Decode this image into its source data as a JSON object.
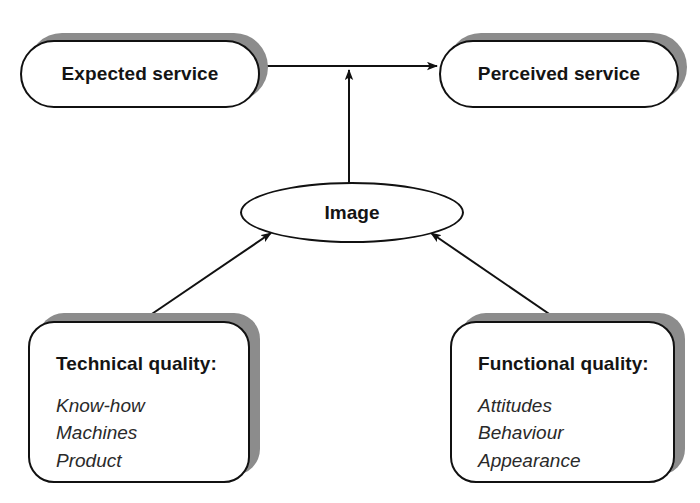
{
  "diagram": {
    "background_color": "#ffffff",
    "line_color": "#111111",
    "shadow_color": "#8c8c8c",
    "text_color": "#141414"
  },
  "nodes": {
    "expected_service": {
      "label": "Expected service",
      "shape": "rounded-pill"
    },
    "perceived_service": {
      "label": "Perceived service",
      "shape": "rounded-pill"
    },
    "image": {
      "label": "Image",
      "shape": "ellipse"
    },
    "technical_quality": {
      "title": "Technical quality:",
      "items": [
        "Know-how",
        "Machines",
        "Product"
      ],
      "shape": "rounded-rect"
    },
    "functional_quality": {
      "title": "Functional quality:",
      "items": [
        "Attitudes",
        "Behaviour",
        "Appearance"
      ],
      "shape": "rounded-rect"
    }
  },
  "connectors": [
    {
      "name": "expected-perceived-link",
      "from": "expected_service",
      "to": "perceived_service",
      "style": "double-headed-horizontal"
    },
    {
      "name": "image-to-services-link",
      "from": "image",
      "to": "expected-perceived-link",
      "style": "single-headed-vertical-up"
    },
    {
      "name": "technical-to-image-link",
      "from": "technical_quality",
      "to": "image",
      "style": "single-headed-diagonal-up-right"
    },
    {
      "name": "functional-to-image-link",
      "from": "functional_quality",
      "to": "image",
      "style": "single-headed-diagonal-up-left"
    }
  ]
}
